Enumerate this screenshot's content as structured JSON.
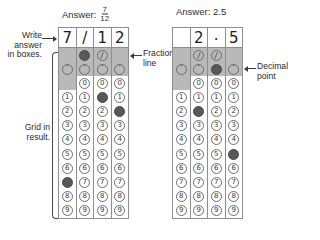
{
  "examples": [
    {
      "id": "fraction-example",
      "caption_prefix": "Answer:",
      "caption_value_type": "fraction",
      "caption_numerator": "7",
      "caption_denominator": "12",
      "caption_plain": "Answer: 7/12",
      "written": [
        "7",
        "/",
        "1",
        "2"
      ],
      "columns": [
        {
          "index": 1,
          "fraction_bubble": "none",
          "decimal_bubble": "empty",
          "zero_bubble": "none",
          "marked_digit": "7"
        },
        {
          "index": 2,
          "fraction_bubble": "filled",
          "decimal_bubble": "empty",
          "zero_bubble": "empty",
          "marked_digit": null
        },
        {
          "index": 3,
          "fraction_bubble": "empty",
          "decimal_bubble": "empty",
          "zero_bubble": "empty",
          "marked_digit": "1"
        },
        {
          "index": 4,
          "fraction_bubble": "none",
          "decimal_bubble": "empty",
          "zero_bubble": "empty",
          "marked_digit": "2"
        }
      ]
    },
    {
      "id": "decimal-example",
      "caption_prefix": "Answer:",
      "caption_value_type": "plain",
      "caption_numerator": "",
      "caption_denominator": "",
      "caption_plain": "Answer: 2.5",
      "written": [
        "",
        "2",
        ".",
        "5"
      ],
      "columns": [
        {
          "index": 1,
          "fraction_bubble": "none",
          "decimal_bubble": "empty",
          "zero_bubble": "none",
          "marked_digit": null
        },
        {
          "index": 2,
          "fraction_bubble": "empty",
          "decimal_bubble": "empty",
          "zero_bubble": "empty",
          "marked_digit": "2"
        },
        {
          "index": 3,
          "fraction_bubble": "empty",
          "decimal_bubble": "filled",
          "zero_bubble": "empty",
          "marked_digit": null
        },
        {
          "index": 4,
          "fraction_bubble": "none",
          "decimal_bubble": "empty",
          "zero_bubble": "empty",
          "marked_digit": "5"
        }
      ]
    }
  ],
  "digits": [
    "0",
    "1",
    "2",
    "3",
    "4",
    "5",
    "6",
    "7",
    "8",
    "9"
  ],
  "symbols": {
    "fraction_slash": "/",
    "decimal_dot": "·"
  },
  "annotations": {
    "write_answer": "Write\nanswer\nin boxes.",
    "grid_in_result": "Grid in\nresult.",
    "fraction_line": "Fraction\nline",
    "decimal_point": "Decimal\npoint",
    "arrow_left_to_right": "→",
    "arrow_right_to_left": "←"
  },
  "colors": {
    "shade": "#b9b9b9",
    "bubble_fill": "#585858",
    "bubble_stroke": "#6d6d6d",
    "grid_border": "#8d8d8d",
    "text": "#2b2b2b",
    "page_background": "#ffffff"
  }
}
